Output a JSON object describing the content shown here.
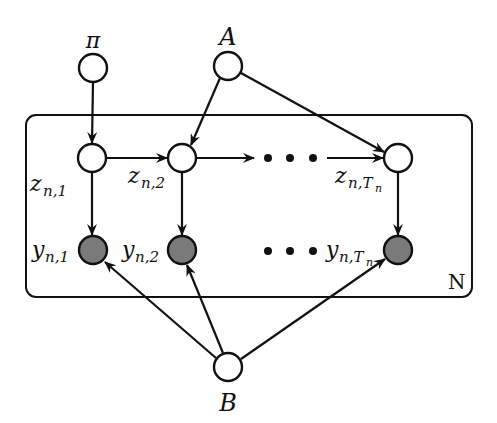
{
  "diagram": {
    "type": "graphical-model",
    "plate": {
      "label": "N",
      "x": 26,
      "y": 115,
      "width": 446,
      "height": 182,
      "radius": 10
    },
    "nodes": [
      {
        "id": "pi",
        "label": "π",
        "sub": "",
        "x": 93,
        "y": 68,
        "observed": false,
        "label_x": 93,
        "label_y": 47
      },
      {
        "id": "A",
        "label": "A",
        "sub": "",
        "x": 228,
        "y": 66,
        "observed": false,
        "label_x": 228,
        "label_y": 45
      },
      {
        "id": "z1",
        "label": "z",
        "sub": "n,1",
        "x": 92,
        "y": 158,
        "observed": false
      },
      {
        "id": "z2",
        "label": "z",
        "sub": "n,2",
        "x": 182,
        "y": 158,
        "observed": false
      },
      {
        "id": "zT",
        "label": "z",
        "sub": "n,Tn",
        "x": 398,
        "y": 158,
        "observed": false
      },
      {
        "id": "y1",
        "label": "y",
        "sub": "n,1",
        "x": 93,
        "y": 250,
        "observed": true
      },
      {
        "id": "y2",
        "label": "y",
        "sub": "n,2",
        "x": 182,
        "y": 250,
        "observed": true
      },
      {
        "id": "yT",
        "label": "y",
        "sub": "n,Tn",
        "x": 398,
        "y": 250,
        "observed": true
      },
      {
        "id": "B",
        "label": "B",
        "sub": "",
        "x": 228,
        "y": 367,
        "observed": false,
        "label_x": 228,
        "label_y": 410
      }
    ],
    "edges": [
      {
        "from": "pi",
        "to": "z1"
      },
      {
        "from": "A",
        "to": "z2"
      },
      {
        "from": "A",
        "to": "zT"
      },
      {
        "from": "z1",
        "to": "z2"
      },
      {
        "from": "z2",
        "to": "dots"
      },
      {
        "from": "dots",
        "to": "zT"
      },
      {
        "from": "z1",
        "to": "y1"
      },
      {
        "from": "z2",
        "to": "y2"
      },
      {
        "from": "zT",
        "to": "yT"
      },
      {
        "from": "B",
        "to": "y1"
      },
      {
        "from": "B",
        "to": "y2"
      },
      {
        "from": "B",
        "to": "yT"
      }
    ],
    "labels": {
      "pi": "π",
      "A": "A",
      "B": "B",
      "N": "N",
      "z1_main": "z",
      "z1_sub": "n,1",
      "z2_main": "z",
      "z2_sub": "n,2",
      "zT_main": "z",
      "zT_sub": "n,T",
      "zT_subsub": "n",
      "y1_main": "y",
      "y1_sub": "n,1",
      "y2_main": "y",
      "y2_sub": "n,2",
      "yT_main": "y",
      "yT_sub": "n,T",
      "yT_subsub": "n"
    },
    "colors": {
      "stroke": "#111111",
      "observed_fill": "#7a7a7a",
      "latent_fill": "#ffffff",
      "background": "#ffffff"
    }
  }
}
